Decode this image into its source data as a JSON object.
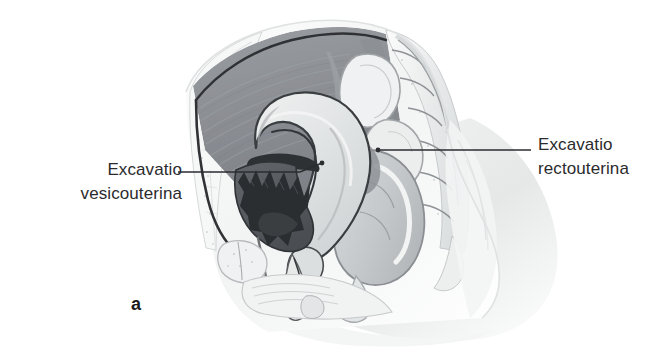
{
  "figure": {
    "panel_letter": "a",
    "background_color": "#ffffff",
    "text_color": "#2b2b2d",
    "width": 670,
    "height": 348
  },
  "labels": {
    "left": {
      "line1": "Excavatio",
      "line2": "vesicouterina",
      "leader": {
        "from_x": 178,
        "from_y": 172,
        "bend_x": 300,
        "bend_y": 172,
        "to_x": 322,
        "to_y": 163
      }
    },
    "right": {
      "line1": "Excavatio",
      "line2": "rectouterina",
      "leader": {
        "from_x": 531,
        "from_y": 150,
        "to_x": 378,
        "to_y": 150
      }
    }
  },
  "illustration": {
    "style": "grayscale medical halftone drawing",
    "palette": {
      "outline_dark": "#2f3033",
      "cavity_gray": "#8d9094",
      "cavity_gray_light": "#a9adb1",
      "organ_light": "#e4e6e7",
      "organ_mid": "#c6c9cb",
      "bladder_dark": "#3a3d41",
      "bladder_mid": "#6d7175",
      "bone_light": "#eef0f0",
      "soft_tissue": "#f0f1f2",
      "body_fade": "#f7f8f8"
    },
    "structures": [
      "anterior abdominal wall",
      "abdominal cavity with peritoneal lining",
      "uterus",
      "uterine cavity",
      "urinary bladder",
      "vagina",
      "pubic symphysis",
      "rectum",
      "sigmoid colon",
      "sacrum and coccyx",
      "lumbar vertebra",
      "pelvic floor",
      "gluteal body contour"
    ]
  }
}
